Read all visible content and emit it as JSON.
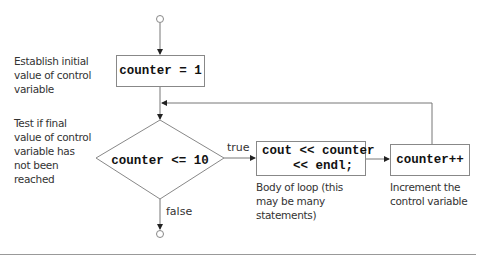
{
  "diagram": {
    "type": "flowchart",
    "nodes": {
      "start": {
        "shape": "circle"
      },
      "init": {
        "shape": "rect",
        "text": "counter = 1",
        "note": "Establish initial value of control variable"
      },
      "condition": {
        "shape": "diamond",
        "text": "counter <= 10",
        "note": "Test if final value of control variable has not been reached"
      },
      "body": {
        "shape": "rect",
        "text_line1": "cout << counter",
        "text_line2": "<< endl;",
        "note": "Body of loop (this may be many statements)"
      },
      "increment": {
        "shape": "rect",
        "text": "counter++",
        "note": "Increment the control variable"
      },
      "end": {
        "shape": "circle"
      }
    },
    "edges": [
      {
        "from": "start",
        "to": "init",
        "label": ""
      },
      {
        "from": "init",
        "to": "condition",
        "label": ""
      },
      {
        "from": "condition",
        "to": "body",
        "label": "true"
      },
      {
        "from": "body",
        "to": "increment",
        "label": ""
      },
      {
        "from": "increment",
        "to": "condition",
        "label": ""
      },
      {
        "from": "condition",
        "to": "end",
        "label": "false"
      }
    ],
    "labels": {
      "true": "true",
      "false": "false"
    },
    "notes": {
      "init_l1": "Establish initial",
      "init_l2": "value of control",
      "init_l3": "variable",
      "cond_l1": "Test if final",
      "cond_l2": "value of control",
      "cond_l3": "variable has",
      "cond_l4": "not been",
      "cond_l5": "reached",
      "body_l1": "Body of loop (this",
      "body_l2": "may be many",
      "body_l3": "statements)",
      "inc_l1": "Increment the",
      "inc_l2": "control variable"
    },
    "colors": {
      "line": "#777777",
      "box_border": "#888888",
      "text": "#333333"
    }
  }
}
